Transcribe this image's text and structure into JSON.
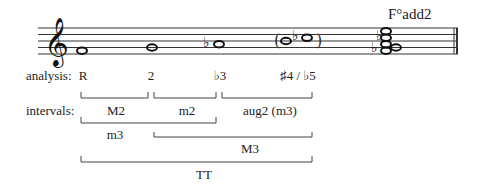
{
  "chord_label": "F°add2",
  "analysis": {
    "label": "analysis:",
    "degrees": [
      "R",
      "2",
      "♭3",
      "♯4 / ♭5"
    ]
  },
  "intervals": {
    "label": "intervals:",
    "row1": [
      "M2",
      "m2",
      "aug2 (m3)"
    ],
    "row2": "m3",
    "row3": "M3",
    "row4": "TT"
  },
  "staff": {
    "clef": "treble",
    "notes": [
      "F4",
      "G4",
      "A♭4",
      "(B4 C♭5)",
      "chord F A♭ B C♭ with G"
    ],
    "colors": {
      "ink": "#222222",
      "background": "#ffffff"
    }
  }
}
